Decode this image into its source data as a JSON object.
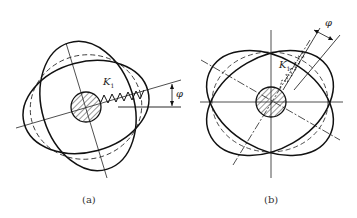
{
  "figure": {
    "panels": [
      {
        "id": "a",
        "caption": "(a)",
        "spring_label": "K",
        "spring_subscript": "1",
        "angle_label": "φ"
      },
      {
        "id": "b",
        "caption": "(b)",
        "spring_label": "K",
        "spring_subscript": "1",
        "angle_label": "φ"
      }
    ],
    "colors": {
      "line": "#1a1a1a",
      "hatch": "#333333",
      "background": "#ffffff"
    }
  }
}
